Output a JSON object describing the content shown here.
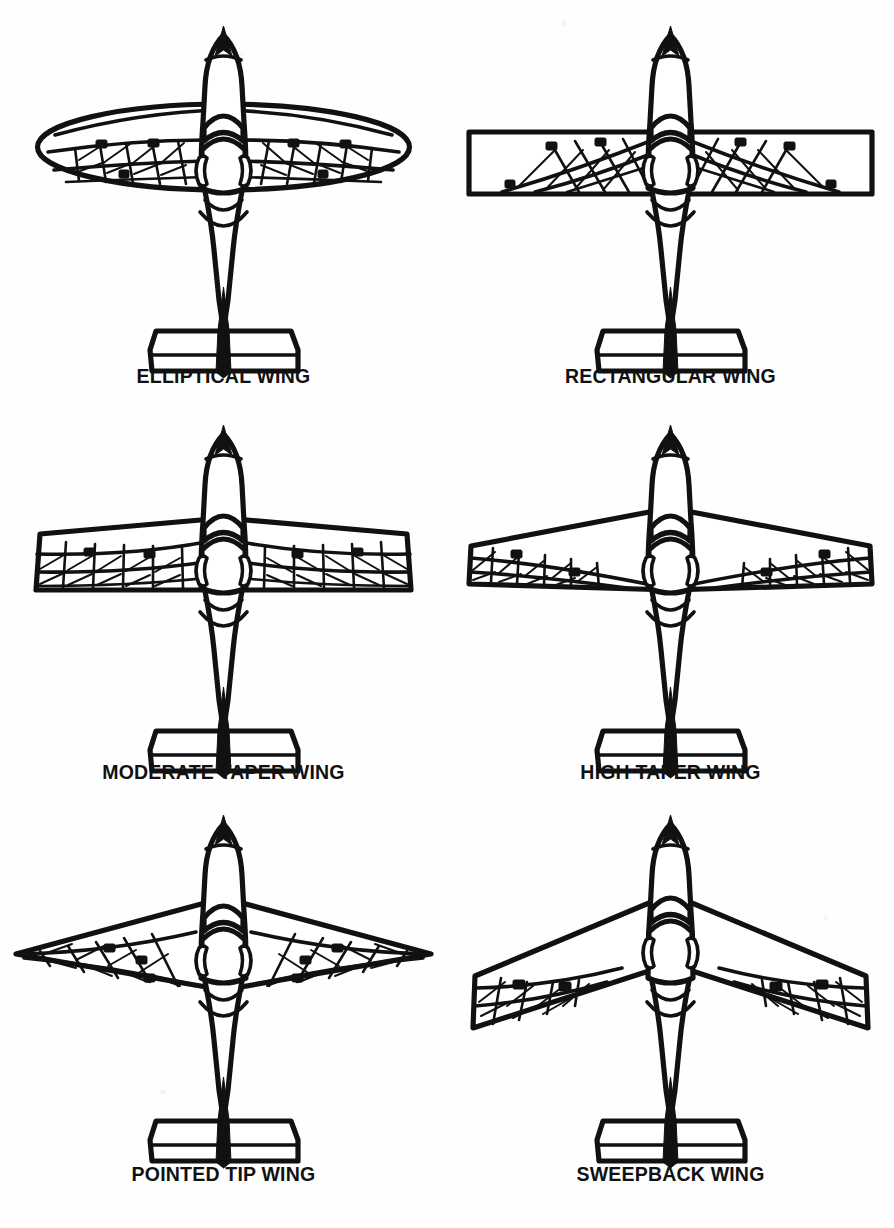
{
  "document": {
    "title": "Wing Planform Types",
    "background_color": "#ffffff",
    "ink_color": "#111111",
    "kind": "line-art technical illustration",
    "layout": {
      "columns": 2,
      "rows": 3,
      "width": 894,
      "height": 1228
    }
  },
  "figures": [
    {
      "id": "elliptical",
      "caption": "ELLIPTICAL WING",
      "planform": "elliptical",
      "row": 1,
      "column": 1,
      "aircraft": "single-engine propeller aircraft, top plan view, cutaway wing structure"
    },
    {
      "id": "rectangular",
      "caption": "RECTANGULAR WING",
      "planform": "rectangular",
      "row": 1,
      "column": 2,
      "aircraft": "single-engine propeller aircraft, top plan view, cutaway wing structure"
    },
    {
      "id": "moderate-taper",
      "caption": "MODERATE TAPER WING",
      "planform": "moderate taper",
      "row": 2,
      "column": 1,
      "aircraft": "single-engine propeller aircraft, top plan view, cutaway wing structure"
    },
    {
      "id": "high-taper",
      "caption": "HIGH TAPER WING",
      "planform": "high taper",
      "row": 2,
      "column": 2,
      "aircraft": "single-engine propeller aircraft, top plan view, cutaway wing structure"
    },
    {
      "id": "pointed-tip",
      "caption": "POINTED TIP WING",
      "planform": "pointed tip",
      "row": 3,
      "column": 1,
      "aircraft": "single-engine propeller aircraft, top plan view, cutaway wing structure"
    },
    {
      "id": "sweepback",
      "caption": "SWEEPBACK WING",
      "planform": "sweepback",
      "row": 3,
      "column": 2,
      "aircraft": "single-engine propeller aircraft, top plan view, cutaway wing structure"
    }
  ]
}
